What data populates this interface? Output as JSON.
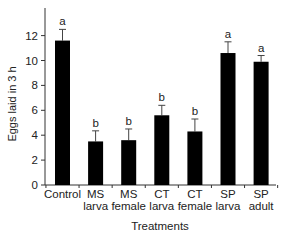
{
  "chart_data": {
    "type": "bar",
    "title": "",
    "xlabel": "Treatments",
    "ylabel": "Eggs laid in 3 h",
    "ylim": [
      0,
      13.5
    ],
    "yticks": [
      0,
      2,
      4,
      6,
      8,
      10,
      12
    ],
    "grid": false,
    "legend": null,
    "categories": [
      [
        "Control"
      ],
      [
        "MS",
        "larva"
      ],
      [
        "MS",
        "female"
      ],
      [
        "CT",
        "larva"
      ],
      [
        "CT",
        "female"
      ],
      [
        "SP",
        "larva"
      ],
      [
        "SP",
        "adult"
      ]
    ],
    "category_names": [
      "Control",
      "MS larva",
      "MS female",
      "CT larva",
      "CT female",
      "SP larva",
      "SP adult"
    ],
    "values": [
      11.6,
      3.5,
      3.6,
      5.6,
      4.3,
      10.6,
      9.9
    ],
    "error_upper": [
      0.9,
      0.85,
      0.9,
      0.8,
      1.0,
      0.9,
      0.5
    ],
    "annotations": [
      "a",
      "b",
      "b",
      "b",
      "b",
      "a",
      "a"
    ],
    "bar_color": "#000000"
  }
}
